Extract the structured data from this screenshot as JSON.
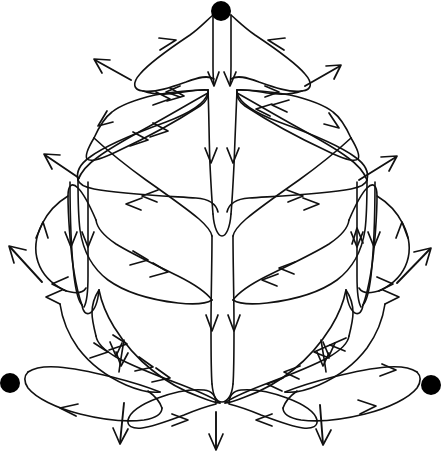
{
  "figure": {
    "kind": "line-diagram",
    "width": 442,
    "height": 453,
    "background_color": "#ffffff",
    "stroke_color": "#111111",
    "dot_color": "#000000",
    "symmetry": "3-fold rotational (order 3) about the centre",
    "stroke_width": 1.6
  },
  "vertices": [
    {
      "name": "top-vertex-dot",
      "cx": 221,
      "cy": 11,
      "r": 10
    },
    {
      "name": "bottom-left-vertex-dot",
      "cx": 10,
      "cy": 383,
      "r": 10
    },
    {
      "name": "bottom-right-vertex-dot",
      "cx": 431,
      "cy": 385,
      "r": 10
    }
  ],
  "free_arrows": [
    {
      "name": "free-arrow-upper-left",
      "x1": 131,
      "y1": 80,
      "x2": 95,
      "y2": 60
    },
    {
      "name": "free-arrow-upper-right",
      "x1": 305,
      "y1": 86,
      "x2": 340,
      "y2": 66
    },
    {
      "name": "free-arrow-left-upper",
      "x1": 79,
      "y1": 178,
      "x2": 45,
      "y2": 155
    },
    {
      "name": "free-arrow-right-upper",
      "x1": 359,
      "y1": 180,
      "x2": 396,
      "y2": 157
    },
    {
      "name": "free-arrow-left-mid",
      "x1": 42,
      "y1": 282,
      "x2": 10,
      "y2": 247
    },
    {
      "name": "free-arrow-right-mid",
      "x1": 397,
      "y1": 283,
      "x2": 430,
      "y2": 249
    },
    {
      "name": "free-arrow-bottom-left",
      "x1": 124,
      "y1": 403,
      "x2": 120,
      "y2": 443
    },
    {
      "name": "free-arrow-bottom-mid",
      "x1": 216,
      "y1": 412,
      "x2": 216,
      "y2": 449
    },
    {
      "name": "free-arrow-bottom-right",
      "x1": 320,
      "y1": 405,
      "x2": 323,
      "y2": 444
    }
  ],
  "annotations": {
    "arrow_count": 9,
    "dot_count": 3
  }
}
